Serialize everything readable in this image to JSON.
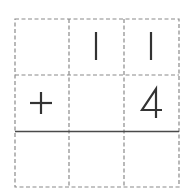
{
  "problem": {
    "operator": "+",
    "rows": [
      {
        "name": "addend-1",
        "cells": [
          "",
          "1",
          "1"
        ]
      },
      {
        "name": "addend-2",
        "cells": [
          "+",
          "",
          "4"
        ]
      },
      {
        "name": "answer",
        "cells": [
          "",
          "",
          ""
        ]
      }
    ]
  },
  "colors": {
    "grid": "#8a8a8a",
    "sum_line": "#4a4a4a",
    "ink": "#333333"
  }
}
